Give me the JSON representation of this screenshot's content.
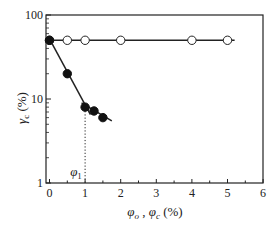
{
  "chart_data": {
    "type": "scatter",
    "title": "",
    "xlabel": "φo , φc (%)",
    "ylabel": "γc (%)",
    "xlim": [
      0,
      6
    ],
    "ylim": [
      1,
      100
    ],
    "yscale": "log",
    "x_ticks": [
      "0",
      "1",
      "2",
      "3",
      "4",
      "5",
      "6"
    ],
    "y_ticks": [
      "1",
      "10",
      "100"
    ],
    "grid": false,
    "legend": null,
    "annotations": [
      {
        "text": "φ1",
        "x": 1.0,
        "note": "dotted vertical line from fitted-line intersection to x-axis"
      }
    ],
    "series": [
      {
        "name": "open circles (φo)",
        "marker": "open-circle",
        "x": [
          0,
          0.5,
          1,
          2,
          4,
          5
        ],
        "y": [
          50,
          50,
          50,
          50,
          50,
          50
        ],
        "fit_line": {
          "x": [
            0,
            5.2
          ],
          "y": [
            50,
            50
          ]
        }
      },
      {
        "name": "filled circles (φc)",
        "marker": "filled-circle",
        "x": [
          0,
          0.5,
          1.0,
          1.25,
          1.5
        ],
        "y": [
          50,
          20,
          8,
          7.2,
          6
        ],
        "fit_lines": [
          {
            "x": [
              0,
              1.15
            ],
            "y": [
              52,
              6.5
            ]
          },
          {
            "x": [
              0.9,
              1.75
            ],
            "y": [
              9,
              5.5
            ]
          }
        ]
      }
    ]
  },
  "labels": {
    "x_axis": {
      "main1": "φ",
      "sub1": "o",
      "sep": " , ",
      "main2": "φ",
      "sub2": "c",
      "unit": " (%)"
    },
    "y_axis": {
      "main": "γ",
      "sub": "c",
      "unit": " (%)"
    },
    "phi1": {
      "main": "φ",
      "sub": "1"
    }
  }
}
